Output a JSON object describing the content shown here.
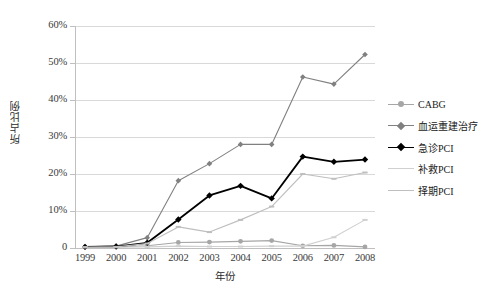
{
  "chart_data": {
    "type": "line",
    "title": "",
    "subtitle": "",
    "xlabel": "年份",
    "ylabel": "所占比例",
    "categories": [
      "1999",
      "2000",
      "2001",
      "2002",
      "2003",
      "2004",
      "2005",
      "2006",
      "2007",
      "2008"
    ],
    "x": [
      1999,
      2000,
      2001,
      2002,
      2003,
      2004,
      2005,
      2006,
      2007,
      2008
    ],
    "ylim": [
      0,
      60
    ],
    "yticks": [
      0,
      10,
      20,
      30,
      40,
      50,
      60
    ],
    "ytick_labels": [
      "0",
      "10%",
      "20%",
      "30%",
      "40%",
      "50%",
      "60%"
    ],
    "grid": "horizontal",
    "legend_position": "right",
    "units": "percent",
    "series": [
      {
        "name": "CABG",
        "color": "#a6a6a6",
        "marker": "circle",
        "values": [
          0.3,
          0.3,
          0.6,
          1.5,
          1.6,
          1.8,
          2.0,
          0.6,
          0.7,
          0.3
        ]
      },
      {
        "name": "血运重建治疗",
        "color": "#808080",
        "marker": "diamond",
        "values": [
          0.3,
          0.5,
          2.8,
          18.2,
          22.8,
          28.0,
          28.0,
          46.2,
          44.3,
          52.3
        ]
      },
      {
        "name": "急诊PCI",
        "color": "#000000",
        "marker": "diamond",
        "values": [
          0.3,
          0.4,
          1.4,
          7.7,
          14.2,
          16.8,
          13.4,
          24.7,
          23.3,
          23.9
        ]
      },
      {
        "name": "补救PCI",
        "color": "#d0d0d0",
        "marker": "dash",
        "values": [
          0.2,
          0.2,
          0.3,
          0.5,
          0.4,
          0.4,
          0.5,
          0.5,
          2.9,
          7.6
        ]
      },
      {
        "name": "择期PCI",
        "color": "#bfbfbf",
        "marker": "dash",
        "values": [
          0.2,
          0.3,
          1.2,
          5.7,
          4.3,
          7.6,
          11.2,
          20.0,
          18.7,
          20.4
        ]
      }
    ]
  },
  "legend": {
    "items": [
      {
        "label": "CABG"
      },
      {
        "label": "血运重建治疗"
      },
      {
        "label": "急诊PCI"
      },
      {
        "label": "补救PCI"
      },
      {
        "label": "择期PCI"
      }
    ]
  }
}
